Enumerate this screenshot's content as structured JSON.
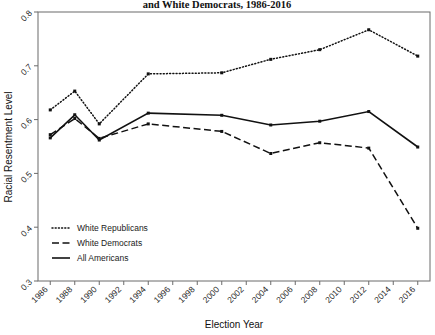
{
  "chart_data": {
    "type": "line",
    "title": "and White Democrats, 1986-2016",
    "xlabel": "Election Year",
    "ylabel": "Racial Resentment Level",
    "grid": false,
    "legend_position": "bottom-left",
    "xlim": [
      1985,
      2017
    ],
    "ylim": [
      0.3,
      0.8
    ],
    "yticks": [
      "0.3",
      "0.4",
      "0.5",
      "0.6",
      "0.7",
      "0.8"
    ],
    "ytick_values": [
      0.3,
      0.4,
      0.5,
      0.6,
      0.7,
      0.8
    ],
    "categories": [
      1986,
      1988,
      1990,
      1992,
      1994,
      1996,
      1998,
      2000,
      2002,
      2004,
      2006,
      2008,
      2010,
      2012,
      2014,
      2016
    ],
    "xticks": [
      "1986",
      "1988",
      "1990",
      "1992",
      "1994",
      "1996",
      "1998",
      "2000",
      "2002",
      "2004",
      "2006",
      "2008",
      "2010",
      "2012",
      "2014",
      "2016"
    ],
    "series": [
      {
        "name": "White Republicans",
        "style": "dotted",
        "x": [
          1986,
          1988,
          1990,
          1994,
          2000,
          2004,
          2008,
          2012,
          2016
        ],
        "values": [
          0.618,
          0.653,
          0.592,
          0.685,
          0.687,
          0.712,
          0.73,
          0.767,
          0.718
        ]
      },
      {
        "name": "White Democrats",
        "style": "dashed",
        "x": [
          1986,
          1988,
          1990,
          1994,
          2000,
          2004,
          2008,
          2012,
          2016
        ],
        "values": [
          0.572,
          0.602,
          0.565,
          0.592,
          0.578,
          0.537,
          0.557,
          0.547,
          0.398
        ]
      },
      {
        "name": "All Americans",
        "style": "solid",
        "x": [
          1986,
          1988,
          1990,
          1994,
          2000,
          2004,
          2008,
          2012,
          2016
        ],
        "values": [
          0.566,
          0.609,
          0.562,
          0.612,
          0.608,
          0.59,
          0.597,
          0.615,
          0.549
        ]
      }
    ]
  },
  "legend": {
    "items": [
      {
        "label": "White Republicans",
        "style": "dotted"
      },
      {
        "label": "White Democrats",
        "style": "dashed"
      },
      {
        "label": "All Americans",
        "style": "solid"
      }
    ]
  }
}
